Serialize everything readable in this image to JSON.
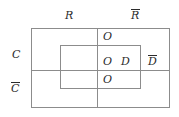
{
  "diagram": {
    "type": "venn-partition-box-diagram",
    "line_color": "#8c8c8c",
    "text_color": "#2b2b2b",
    "background": "#ffffff",
    "column_labels": [
      {
        "id": "R",
        "text": "R",
        "overbar": false
      },
      {
        "id": "Rb",
        "text": "R",
        "overbar": true
      }
    ],
    "row_labels": [
      {
        "id": "C",
        "text": "C",
        "overbar": false
      },
      {
        "id": "Cb",
        "text": "C",
        "overbar": true
      }
    ],
    "inner_region_labels": [
      {
        "id": "o-top",
        "text": "O",
        "overbar": false
      },
      {
        "id": "o-mid",
        "text": "O",
        "overbar": false
      },
      {
        "id": "d-mid",
        "text": "D",
        "overbar": false
      },
      {
        "id": "o-bottom",
        "text": "O",
        "overbar": false
      }
    ],
    "outside_labels": [
      {
        "id": "d-bar",
        "text": "D",
        "overbar": true
      }
    ]
  }
}
